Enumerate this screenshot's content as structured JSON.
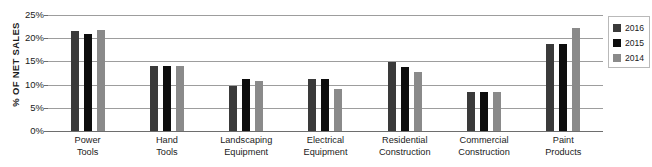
{
  "chart_data": {
    "type": "bar",
    "title": "",
    "xlabel": "",
    "ylabel": "% OF NET SALES",
    "ylim": [
      0,
      25
    ],
    "ytick_labels": [
      "25%",
      "20%",
      "15%",
      "10%",
      "5%",
      "0%"
    ],
    "ytick_values": [
      25,
      20,
      15,
      10,
      5,
      0
    ],
    "grid": true,
    "legend_position": "right",
    "categories": [
      "Power Tools",
      "Hand Tools",
      "Landscaping Equipment",
      "Electrical Equipment",
      "Residential Construction",
      "Commercial Construction",
      "Paint Products"
    ],
    "category_lines": [
      [
        "Power",
        "Tools"
      ],
      [
        "Hand",
        "Tools"
      ],
      [
        "Landscaping",
        "Equipment"
      ],
      [
        "Electrical",
        "Equipment"
      ],
      [
        "Residential",
        "Construction"
      ],
      [
        "Commercial",
        "Construction"
      ],
      [
        "Paint",
        "Products"
      ]
    ],
    "series": [
      {
        "name": "2016",
        "color": "#3a3a3a",
        "values": [
          21.5,
          14.0,
          9.7,
          11.2,
          14.8,
          8.5,
          18.7
        ]
      },
      {
        "name": "2015",
        "color": "#0d0d0d",
        "values": [
          21.0,
          14.0,
          11.2,
          11.2,
          13.8,
          8.5,
          18.7
        ]
      },
      {
        "name": "2014",
        "color": "#8a8a8a",
        "values": [
          21.7,
          14.0,
          10.7,
          9.0,
          12.8,
          8.5,
          22.2
        ]
      }
    ]
  },
  "legend": {
    "items": [
      {
        "label": "2016",
        "color": "#3a3a3a"
      },
      {
        "label": "2015",
        "color": "#0d0d0d"
      },
      {
        "label": "2014",
        "color": "#8a8a8a"
      }
    ]
  }
}
